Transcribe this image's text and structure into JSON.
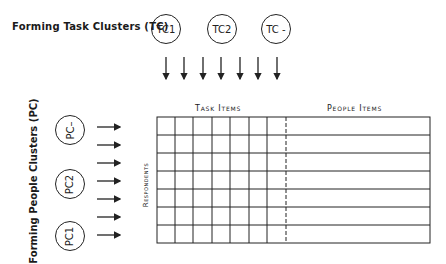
{
  "task_clusters": {
    "label": "Forming Task Clusters (TC)",
    "circles": [
      "TC1",
      "TC2",
      "TC -"
    ],
    "arrow_count": 7
  },
  "people_clusters": {
    "label": "Forming People Clusters (PC)",
    "circles": [
      "PC–",
      "PC2",
      "PC1"
    ],
    "arrow_count": 7
  },
  "matrix": {
    "task_items_header": "Task Items",
    "people_items_header": "People Items",
    "row_label": "Respondents",
    "rows": 7,
    "task_columns": 7
  }
}
